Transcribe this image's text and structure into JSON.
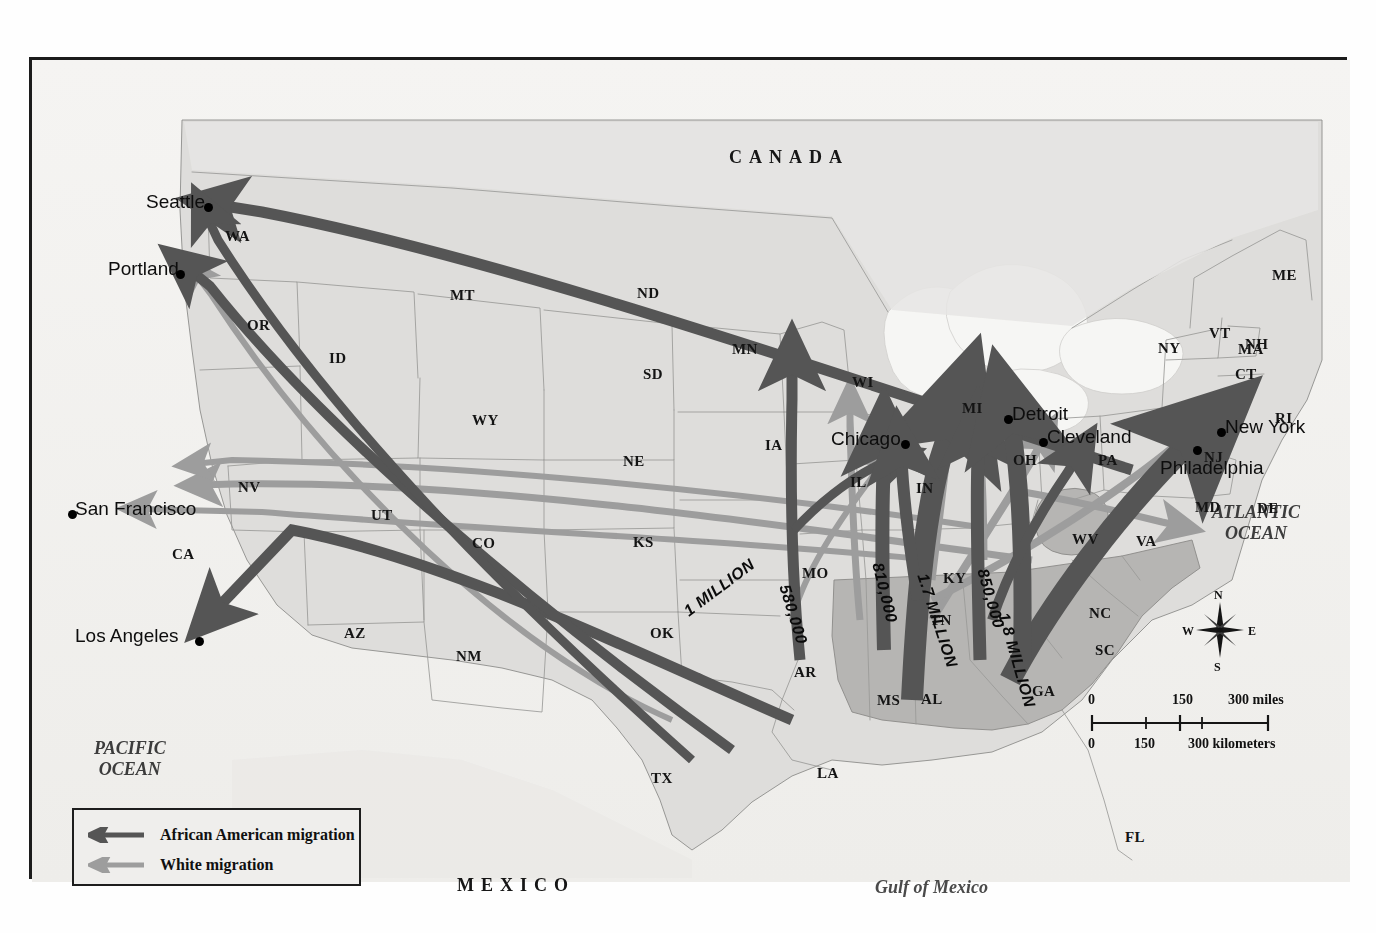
{
  "map": {
    "title": "African American and White Migration, United States",
    "countries": [
      {
        "name": "CANADA",
        "x": 697,
        "y": 88
      },
      {
        "name": "MEXICO",
        "x": 425,
        "y": 816
      }
    ],
    "oceans": [
      {
        "name": "PACIFIC OCEAN",
        "x": 62,
        "y": 678
      },
      {
        "name": "ATLANTIC OCEAN",
        "x": 1180,
        "y": 442
      },
      {
        "name": "Gulf of Mexico",
        "x": 843,
        "y": 818
      }
    ],
    "states": [
      {
        "code": "WA",
        "x": 193,
        "y": 169
      },
      {
        "code": "OR",
        "x": 215,
        "y": 258
      },
      {
        "code": "CA",
        "x": 140,
        "y": 487
      },
      {
        "code": "NV",
        "x": 206,
        "y": 420
      },
      {
        "code": "ID",
        "x": 297,
        "y": 291
      },
      {
        "code": "MT",
        "x": 418,
        "y": 228
      },
      {
        "code": "WY",
        "x": 440,
        "y": 353
      },
      {
        "code": "UT",
        "x": 339,
        "y": 448
      },
      {
        "code": "AZ",
        "x": 312,
        "y": 566
      },
      {
        "code": "CO",
        "x": 440,
        "y": 476
      },
      {
        "code": "NM",
        "x": 424,
        "y": 589
      },
      {
        "code": "ND",
        "x": 605,
        "y": 226
      },
      {
        "code": "SD",
        "x": 611,
        "y": 307
      },
      {
        "code": "NE",
        "x": 591,
        "y": 394
      },
      {
        "code": "KS",
        "x": 601,
        "y": 475
      },
      {
        "code": "OK",
        "x": 618,
        "y": 566
      },
      {
        "code": "TX",
        "x": 619,
        "y": 711
      },
      {
        "code": "MN",
        "x": 700,
        "y": 282
      },
      {
        "code": "IA",
        "x": 733,
        "y": 378
      },
      {
        "code": "MO",
        "x": 770,
        "y": 506
      },
      {
        "code": "AR",
        "x": 762,
        "y": 605
      },
      {
        "code": "LA",
        "x": 785,
        "y": 706
      },
      {
        "code": "WI",
        "x": 820,
        "y": 315
      },
      {
        "code": "IL",
        "x": 818,
        "y": 415
      },
      {
        "code": "MI",
        "x": 930,
        "y": 341
      },
      {
        "code": "IN",
        "x": 884,
        "y": 421
      },
      {
        "code": "OH",
        "x": 981,
        "y": 393
      },
      {
        "code": "KY",
        "x": 911,
        "y": 511
      },
      {
        "code": "TN",
        "x": 898,
        "y": 553
      },
      {
        "code": "MS",
        "x": 845,
        "y": 633
      },
      {
        "code": "AL",
        "x": 889,
        "y": 632
      },
      {
        "code": "GA",
        "x": 1000,
        "y": 624
      },
      {
        "code": "FL",
        "x": 1093,
        "y": 770
      },
      {
        "code": "SC",
        "x": 1063,
        "y": 583
      },
      {
        "code": "NC",
        "x": 1057,
        "y": 546
      },
      {
        "code": "VA",
        "x": 1104,
        "y": 474
      },
      {
        "code": "WV",
        "x": 1040,
        "y": 472
      },
      {
        "code": "PA",
        "x": 1066,
        "y": 393
      },
      {
        "code": "MD",
        "x": 1163,
        "y": 440
      },
      {
        "code": "DE",
        "x": 1225,
        "y": 441
      },
      {
        "code": "NJ",
        "x": 1172,
        "y": 390
      },
      {
        "code": "NY",
        "x": 1126,
        "y": 281
      },
      {
        "code": "CT",
        "x": 1203,
        "y": 307
      },
      {
        "code": "RI",
        "x": 1243,
        "y": 351
      },
      {
        "code": "MA",
        "x": 1206,
        "y": 282
      },
      {
        "code": "VT",
        "x": 1177,
        "y": 266
      },
      {
        "code": "NH",
        "x": 1213,
        "y": 277
      },
      {
        "code": "ME",
        "x": 1240,
        "y": 208
      }
    ],
    "cities": [
      {
        "name": "Seattle",
        "label_x": 114,
        "label_y": 132,
        "dot_x": 172,
        "dot_y": 143,
        "anchor": "right"
      },
      {
        "name": "Portland",
        "label_x": 76,
        "label_y": 199,
        "dot_x": 144,
        "dot_y": 210,
        "anchor": "right"
      },
      {
        "name": "San Francisco",
        "label_x": 43,
        "label_y": 439,
        "dot_x": 36,
        "dot_y": 450,
        "anchor": "left"
      },
      {
        "name": "Los Angeles",
        "label_x": 43,
        "label_y": 566,
        "dot_x": 163,
        "dot_y": 577,
        "anchor": "left"
      },
      {
        "name": "Chicago",
        "label_x": 799,
        "label_y": 369,
        "dot_x": 869,
        "dot_y": 380,
        "anchor": "right"
      },
      {
        "name": "Detroit",
        "label_x": 980,
        "label_y": 344,
        "dot_x": 972,
        "dot_y": 355,
        "anchor": "left"
      },
      {
        "name": "Cleveland",
        "label_x": 1015,
        "label_y": 367,
        "dot_x": 1007,
        "dot_y": 378,
        "anchor": "left"
      },
      {
        "name": "New York",
        "label_x": 1193,
        "label_y": 357,
        "dot_x": 1185,
        "dot_y": 368,
        "anchor": "left"
      },
      {
        "name": "Philadelphia",
        "label_x": 1128,
        "label_y": 398,
        "dot_x": 1161,
        "dot_y": 386,
        "anchor": "left"
      }
    ],
    "flow_labels": [
      {
        "text": "1 MILLION",
        "x": 654,
        "y": 545,
        "rotate": -37
      },
      {
        "text": "580,000",
        "x": 752,
        "y": 517,
        "rotate": 73
      },
      {
        "text": "810,000",
        "x": 845,
        "y": 495,
        "rotate": 76
      },
      {
        "text": "1.7 MILLION",
        "x": 890,
        "y": 506,
        "rotate": 72
      },
      {
        "text": "850,000",
        "x": 950,
        "y": 501,
        "rotate": 74
      },
      {
        "text": "1.8 MILLION",
        "x": 971,
        "y": 545,
        "rotate": 74
      }
    ],
    "legend": {
      "items": [
        {
          "label": "African American migration",
          "color": "#555555"
        },
        {
          "label": "White migration",
          "color": "#9d9d9d"
        }
      ]
    },
    "compass": {
      "north": "N",
      "south": "S",
      "east": "E",
      "west": "W"
    },
    "scale": {
      "miles": {
        "ticks": [
          "0",
          "150",
          "300"
        ],
        "unit": "300 miles"
      },
      "kilometers": {
        "ticks": [
          "0",
          "150",
          "300"
        ],
        "unit": "300 kilometers"
      },
      "miles_labels": [
        "0",
        "150",
        "300 miles"
      ],
      "km_labels": [
        "0",
        "150",
        "300 kilometers"
      ]
    },
    "colors": {
      "african_american_arrow": "#555555",
      "white_arrow": "#9d9d9d",
      "land": "#dedddb",
      "south_shade": "#b4b3b1",
      "water": "#f3f2f0",
      "border": "#1c1c1c"
    }
  },
  "chart_data": {
    "type": "map",
    "flows": [
      {
        "label": "1 MILLION",
        "value": 1000000,
        "group": "African American",
        "from": "Deep South / Gulf",
        "to": "West Coast (Los Angeles, Portland, Seattle)"
      },
      {
        "label": "580,000",
        "value": 580000,
        "group": "African American",
        "from": "Arkansas / Mississippi Valley",
        "to": "Upper Midwest (Minnesota / Iowa)"
      },
      {
        "label": "810,000",
        "value": 810000,
        "group": "African American",
        "from": "Mississippi",
        "to": "Chicago / Illinois"
      },
      {
        "label": "1.7 MILLION",
        "value": 1700000,
        "group": "African American",
        "from": "Alabama / Tennessee",
        "to": "Chicago, Detroit"
      },
      {
        "label": "850,000",
        "value": 850000,
        "group": "African American",
        "from": "Georgia / Tennessee",
        "to": "Michigan / Ohio"
      },
      {
        "label": "1.8 MILLION",
        "value": 1800000,
        "group": "African American",
        "from": "Georgia / Carolinas",
        "to": "New York, Philadelphia"
      }
    ],
    "legend_entries": [
      "African American migration",
      "White migration"
    ],
    "destination_cities": [
      "Seattle",
      "Portland",
      "San Francisco",
      "Los Angeles",
      "Chicago",
      "Detroit",
      "Cleveland",
      "New York",
      "Philadelphia"
    ],
    "origin_region_states": [
      "MS",
      "AL",
      "GA",
      "SC",
      "NC",
      "WV"
    ]
  }
}
